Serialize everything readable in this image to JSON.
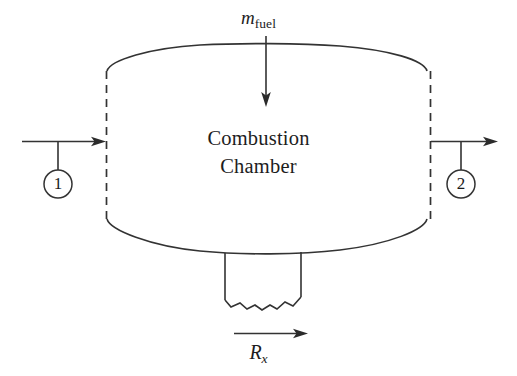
{
  "diagram": {
    "chamber": {
      "label_line1": "Combustion",
      "label_line2": "Chamber"
    },
    "fuel_inlet": {
      "symbol": "m",
      "subscript": "fuel",
      "arrow_direction": "down"
    },
    "reaction_force": {
      "symbol": "R",
      "subscript": "x",
      "arrow_direction": "right"
    },
    "stations": [
      {
        "id": "1",
        "label": "1",
        "side": "left",
        "arrow_direction": "right"
      },
      {
        "id": "2",
        "label": "2",
        "side": "right",
        "arrow_direction": "right"
      }
    ],
    "colors": {
      "stroke": "#333333",
      "text": "#1d1d1d",
      "background": "#ffffff",
      "arrowhead": "#2b2b2b"
    },
    "boundary_style": "dashed-control-volume"
  }
}
